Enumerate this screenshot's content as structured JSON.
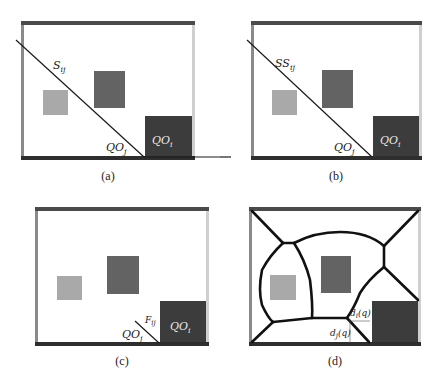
{
  "colors": {
    "frame_top_bottom": "#4a4a4a",
    "frame_left": "#8a8a8a",
    "frame_right": "#cfcfcf",
    "light_square": "#a9a9a9",
    "medium_square": "#636363",
    "dark_square": "#3c3c3c",
    "line": "#1a1a1a"
  },
  "panels": [
    {
      "caption": "(a)",
      "line_label": "S",
      "line_label_sub": "ij",
      "qoj_label": "QO",
      "qoj_sub": "j",
      "qoi_label": "QO",
      "qoi_sub": "i"
    },
    {
      "caption": "(b)",
      "line_label": "SS",
      "line_label_sub": "ij",
      "qoj_label": "QO",
      "qoj_sub": "j",
      "qoi_label": "QO",
      "qoi_sub": "i"
    },
    {
      "caption": "(c)",
      "line_label": "F",
      "line_label_sub": "ij",
      "qoj_label": "QO",
      "qoj_sub": "j",
      "qoi_label": "QO",
      "qoi_sub": "i"
    },
    {
      "caption": "(d)",
      "di_label": "d",
      "di_sub": "i",
      "di_arg": "(q)",
      "dj_label": "d",
      "dj_sub": "j",
      "dj_arg": "(q)"
    }
  ]
}
